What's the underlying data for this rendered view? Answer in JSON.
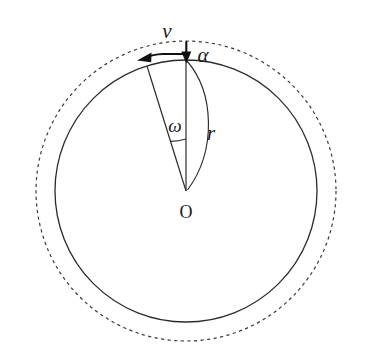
{
  "figure": {
    "background_color": "#ffffff",
    "stroke_color": "#2b2b2b",
    "labels": {
      "velocity": "v",
      "angular_acceleration": "α",
      "angular_velocity": "ω",
      "radius": "r",
      "center": "O"
    }
  },
  "geometry": {
    "center": {
      "x": 186,
      "y": 191
    },
    "solid_circle": {
      "cx": 186,
      "cy": 191,
      "r": 131,
      "style": "solid"
    },
    "dashed_circle": {
      "cx": 186,
      "cy": 191,
      "r": 150,
      "style": "dashed"
    },
    "top_point": {
      "x": 186,
      "y": 60
    },
    "radius_vertical": {
      "from_x": 186,
      "from_y": 191,
      "to_x": 186,
      "to_y": 60
    },
    "radius_slanted": {
      "from_x": 186,
      "from_y": 191,
      "to_x": 147,
      "to_y": 66,
      "angle_deg_from_vertical": 17
    },
    "omega_arc_radius": 52,
    "r_arc": {
      "start_x": 186,
      "start_y": 60,
      "end_x": 186,
      "end_y": 191,
      "bulge": "right"
    },
    "velocity_arrow": {
      "from_x": 186,
      "from_y": 55,
      "to_x": 140,
      "to_y": 53,
      "direction": "left"
    },
    "alpha_arrow": {
      "from_x": 186,
      "from_y": 40,
      "to_x": 186,
      "to_y": 62,
      "direction": "down"
    }
  },
  "label_positions": {
    "velocity": {
      "x": 167,
      "y": 33
    },
    "angular_acceleration": {
      "x": 203,
      "y": 57
    },
    "angular_velocity": {
      "x": 175,
      "y": 128
    },
    "radius": {
      "x": 211,
      "y": 135
    },
    "center": {
      "x": 186,
      "y": 214
    }
  }
}
